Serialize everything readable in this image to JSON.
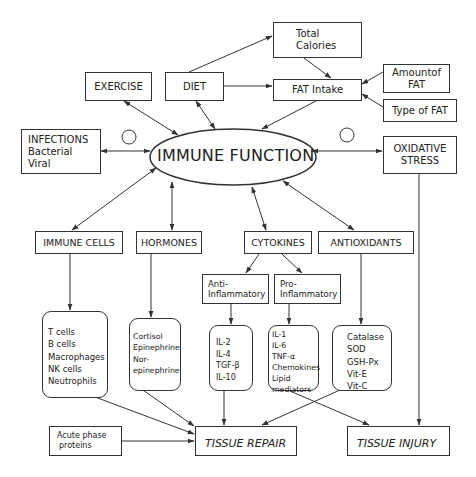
{
  "center": {
    "label": "IMMUNE FUNCTION"
  },
  "top": {
    "exercise": "EXERCISE",
    "diet": "DIET",
    "total_calories": [
      "Total",
      "Calories"
    ],
    "fat_intake": "FAT Intake",
    "amount_of_fat": [
      "Amountof",
      "FAT"
    ],
    "type_of_fat": "Type of FAT"
  },
  "sides": {
    "infections": [
      "INFECTIONS",
      "Bacterial",
      "Viral"
    ],
    "oxidative_stress": [
      "OXIDATIVE",
      "STRESS"
    ]
  },
  "categories": {
    "immune_cells": "IMMUNE CELLS",
    "hormones": "HORMONES",
    "cytokines": "CYTOKINES",
    "antioxidants": "ANTIOXIDANTS"
  },
  "cytokine_types": {
    "anti": [
      "Anti-",
      "Inflammatory"
    ],
    "pro": [
      "Pro-",
      "Inflammatory"
    ]
  },
  "lists": {
    "immune_cells": [
      "T cells",
      "B cells",
      "Macrophages",
      "NK cells",
      "Neutrophils"
    ],
    "hormones": [
      "Cortisol",
      "Epinephrine",
      "Nor-",
      "epinephrine"
    ],
    "anti_inflammatory": [
      "IL-2",
      "IL-4",
      "TGF-β",
      "IL-10"
    ],
    "pro_inflammatory": [
      "IL-1",
      "IL-6",
      "TNF-α",
      "Chemokines",
      "Lipid",
      "mediators"
    ],
    "antioxidants": [
      "Catalase",
      "SOD",
      "GSH-Px",
      "Vit-E",
      "Vit-C"
    ]
  },
  "outcomes": {
    "acute_phase": [
      "Acute phase",
      "proteins"
    ],
    "tissue_repair": "TISSUE REPAIR",
    "tissue_injury": "TISSUE INJURY"
  },
  "colors": {
    "line": "#333333",
    "background": "#ffffff"
  }
}
